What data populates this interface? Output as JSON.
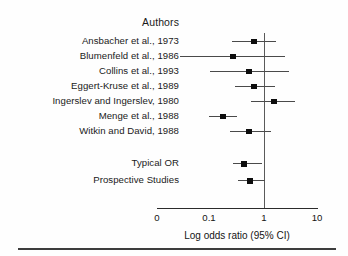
{
  "chart_data": {
    "type": "forest",
    "title": "",
    "column_header": "Authors",
    "xlabel": "Log odds ratio (95% CI)",
    "ylabel": "",
    "xscale": "log",
    "xticks": [
      "0",
      "0.1",
      "1",
      "10"
    ],
    "xtick_positions": [
      157,
      209,
      264,
      317
    ],
    "reference_line": 1,
    "grid": false,
    "legend": "none",
    "rows": [
      {
        "label": "Ansbacher et al., 1973",
        "kind": "study",
        "y": 41,
        "or": 0.72,
        "ci_low": 0.42,
        "ci_high": 1.35,
        "px_marker": 254,
        "px_low": 232,
        "px_high": 276
      },
      {
        "label": "Blumenfeld et al., 1986",
        "kind": "study",
        "y": 56,
        "or": 0.38,
        "ci_low": 0.06,
        "ci_high": 1.72,
        "px_marker": 233,
        "px_low": 180,
        "px_high": 285
      },
      {
        "label": "Collins et al., 1993",
        "kind": "study",
        "y": 71,
        "or": 0.62,
        "ci_low": 0.22,
        "ci_high": 1.95,
        "px_marker": 249,
        "px_low": 210,
        "px_high": 289
      },
      {
        "label": "Eggert-Kruse et al., 1989",
        "kind": "study",
        "y": 86,
        "or": 0.72,
        "ci_low": 0.5,
        "ci_high": 1.28,
        "px_marker": 254,
        "px_low": 235,
        "px_high": 275
      },
      {
        "label": "Ingerslev and Ingerslev, 1980",
        "kind": "study",
        "y": 101,
        "or": 1.4,
        "ci_low": 0.64,
        "ci_high": 2.3,
        "px_marker": 274,
        "px_low": 251,
        "px_high": 295
      },
      {
        "label": "Menge et al., 1988",
        "kind": "study",
        "y": 116,
        "or": 0.21,
        "ci_low": 0.15,
        "ci_high": 0.3,
        "px_marker": 223,
        "px_low": 209,
        "px_high": 237
      },
      {
        "label": "Witkin and David, 1988",
        "kind": "study",
        "y": 131,
        "or": 0.62,
        "ci_low": 0.37,
        "ci_high": 1.1,
        "px_marker": 249,
        "px_low": 230,
        "px_high": 271
      },
      {
        "label": "Typical OR",
        "kind": "summary",
        "y": 163,
        "or": 0.5,
        "ci_low": 0.4,
        "ci_high": 0.9,
        "px_marker": 244,
        "px_low": 233,
        "px_high": 262
      },
      {
        "label": "Prospective Studies",
        "kind": "summary",
        "y": 180,
        "or": 0.6,
        "ci_low": 0.45,
        "ci_high": 1.0,
        "px_marker": 250,
        "px_low": 238,
        "px_high": 265
      }
    ]
  },
  "colors": {
    "marker": "#0d0d0d",
    "ci": "#4a4a4a",
    "reference": "#5a5a5a",
    "axis": "#2b2b2b",
    "text": "#1a1a1a",
    "background": "#fefefe"
  }
}
